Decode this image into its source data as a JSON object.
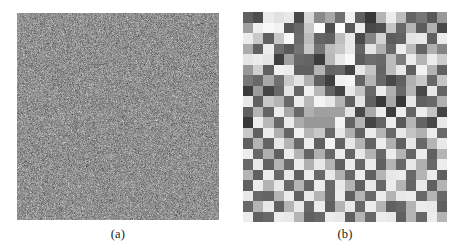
{
  "figure": {
    "background_color": "#ffffff",
    "caption_color": "#1a1a1a",
    "panels": [
      {
        "id": "panel-a",
        "caption": "(a)",
        "kind": "fine-pixel-noise",
        "description": "Uniform random pixel noise image, fine grained, mid-gray mean",
        "x": 17,
        "y": 13,
        "width": 202,
        "height": 207,
        "block_size": 1,
        "grid_cols": 202,
        "grid_rows": 207,
        "mean_gray": "#8f8f8f",
        "noise_amplitude": 62,
        "seed": 20240517
      },
      {
        "id": "panel-b",
        "caption": "(b)",
        "kind": "coarse-block-noise",
        "description": "Blocky random noise image, 20 x 20 square blocks of uniform gray levels",
        "x": 243,
        "y": 12,
        "width": 204,
        "height": 210,
        "block_size": 10.2,
        "grid_cols": 20,
        "grid_rows": 20,
        "mean_gray": "#8f8f8f",
        "noise_amplitude": 118,
        "seed": 775311
      }
    ]
  },
  "captions": {
    "a": "(a)",
    "b": "(b)"
  },
  "chart_data": {
    "type": "heatmap",
    "title": "",
    "xlabel": "",
    "ylabel": "",
    "panels": [
      {
        "label": "(a)",
        "type": "heatmap",
        "colormap": "gray",
        "grid_cols": 202,
        "grid_rows": 207,
        "value_range": [
          0,
          255
        ],
        "mean_value": 143,
        "std_value": 36,
        "note": "High spatial frequency white noise; individual pixels vary independently"
      },
      {
        "label": "(b)",
        "type": "heatmap",
        "colormap": "gray",
        "grid_cols": 20,
        "grid_rows": 20,
        "value_range": [
          0,
          255
        ],
        "mean_value": 143,
        "std_value": 68,
        "note": "Low spatial frequency block noise; 20x20 blocks each a uniform gray level",
        "values": [
          [
            96,
            78,
            235,
            225,
            232,
            72,
            216,
            138,
            168,
            112,
            240,
            96,
            56,
            180,
            236,
            188,
            100,
            118,
            88,
            152
          ],
          [
            160,
            238,
            248,
            242,
            88,
            104,
            200,
            252,
            78,
            252,
            88,
            236,
            72,
            80,
            196,
            104,
            180,
            92,
            176,
            72
          ],
          [
            236,
            200,
            96,
            200,
            248,
            108,
            188,
            100,
            96,
            190,
            232,
            74,
            132,
            210,
            92,
            98,
            228,
            232,
            96,
            234
          ],
          [
            172,
            96,
            236,
            110,
            88,
            116,
            200,
            116,
            188,
            200,
            232,
            100,
            228,
            176,
            104,
            238,
            186,
            100,
            176,
            132
          ],
          [
            230,
            236,
            228,
            62,
            160,
            104,
            100,
            60,
            184,
            232,
            248,
            92,
            108,
            104,
            188,
            124,
            236,
            180,
            236,
            204
          ],
          [
            152,
            208,
            96,
            240,
            236,
            96,
            96,
            180,
            100,
            104,
            68,
            232,
            196,
            100,
            188,
            232,
            96,
            242,
            180,
            96
          ],
          [
            120,
            104,
            168,
            112,
            200,
            228,
            176,
            96,
            62,
            240,
            244,
            100,
            180,
            104,
            72,
            96,
            176,
            200,
            104,
            196
          ],
          [
            60,
            156,
            68,
            104,
            228,
            100,
            240,
            184,
            100,
            68,
            232,
            196,
            104,
            236,
            176,
            104,
            180,
            72,
            232,
            100
          ],
          [
            232,
            96,
            200,
            180,
            104,
            236,
            184,
            244,
            232,
            180,
            96,
            228,
            96,
            56,
            168,
            56,
            232,
            96,
            104,
            176
          ],
          [
            96,
            180,
            100,
            236,
            168,
            104,
            176,
            160,
            160,
            160,
            228,
            72,
            168,
            236,
            60,
            236,
            100,
            236,
            196,
            68
          ],
          [
            56,
            236,
            184,
            104,
            236,
            172,
            152,
            152,
            152,
            244,
            100,
            180,
            68,
            100,
            236,
            88,
            180,
            100,
            72,
            232
          ],
          [
            200,
            96,
            236,
            176,
            100,
            240,
            180,
            200,
            104,
            232,
            176,
            100,
            236,
            180,
            104,
            232,
            196,
            176,
            236,
            104
          ],
          [
            96,
            180,
            100,
            232,
            180,
            104,
            236,
            96,
            244,
            100,
            232,
            180,
            100,
            236,
            176,
            96,
            232,
            104,
            180,
            232
          ],
          [
            236,
            104,
            176,
            96,
            236,
            180,
            100,
            176,
            104,
            236,
            100,
            232,
            180,
            104,
            236,
            180,
            100,
            236,
            96,
            180
          ],
          [
            104,
            232,
            96,
            180,
            104,
            236,
            176,
            232,
            180,
            96,
            236,
            104,
            236,
            96,
            180,
            104,
            232,
            176,
            104,
            236
          ],
          [
            180,
            96,
            236,
            104,
            232,
            96,
            236,
            104,
            232,
            176,
            104,
            236,
            96,
            180,
            232,
            236,
            104,
            180,
            236,
            96
          ],
          [
            96,
            236,
            180,
            232,
            104,
            180,
            100,
            236,
            104,
            232,
            180,
            96,
            232,
            104,
            236,
            180,
            100,
            232,
            96,
            180
          ],
          [
            232,
            104,
            100,
            180,
            236,
            96,
            232,
            180,
            104,
            236,
            96,
            180,
            104,
            236,
            180,
            232,
            236,
            104,
            180,
            104
          ],
          [
            104,
            180,
            232,
            96,
            180,
            232,
            104,
            236,
            96,
            180,
            232,
            104,
            236,
            180,
            96,
            104,
            180,
            236,
            232,
            96
          ],
          [
            236,
            96,
            104,
            236,
            232,
            180,
            96,
            104,
            236,
            232,
            96,
            180,
            104,
            236,
            232,
            96,
            180,
            104,
            236,
            180
          ]
        ]
      }
    ]
  }
}
